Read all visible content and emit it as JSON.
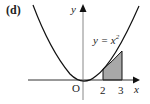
{
  "figure": {
    "label": "(d)",
    "curve_equation_lhs": "y = x",
    "curve_equation_exp": "2",
    "origin_label": "O",
    "x_axis_label": "x",
    "y_axis_label": "y",
    "tick_labels": [
      "2",
      "3"
    ],
    "shaded_region": {
      "from": 2,
      "to": 3,
      "description": "area under y = x^2 between x = 2 and x = 3"
    },
    "colors": {
      "curve": "#111111",
      "axes": "#333333",
      "shade": "#a8a8a8",
      "text": "#222222"
    }
  }
}
